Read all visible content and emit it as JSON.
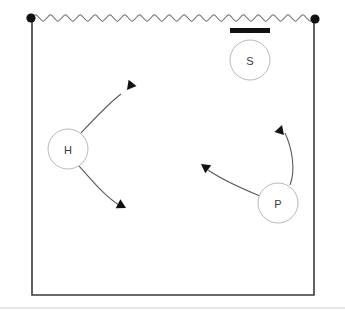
{
  "diagram": {
    "title": "",
    "colors": {
      "frame_stroke": "#3a3a3a",
      "wave_stroke": "#6e6e6e",
      "node_stroke": "#b9b9b9",
      "node_fill": "#ffffff",
      "label_color": "#3b3b3b",
      "arrow_stroke": "#5a5a5a",
      "arrow_fill": "#111111",
      "marker_fill": "#111111",
      "bar_fill": "#111111",
      "baseline_stroke": "#cccccc",
      "background": "#ffffff"
    },
    "frame": {
      "name": "tank-outline",
      "left_x": 32,
      "right_x": 314,
      "top_y": 18,
      "bottom_y": 295
    },
    "surface": {
      "name": "water-surface-wave",
      "label": "wavy free surface",
      "start_x": 32,
      "end_x": 314,
      "y": 18,
      "amplitude": 3.2,
      "periods": 19
    },
    "endpoints": [
      {
        "name": "left-surface-pin",
        "label": "",
        "cx": 31,
        "cy": 18,
        "r": 4.6
      },
      {
        "name": "right-surface-pin",
        "label": "",
        "cx": 315,
        "cy": 19,
        "r": 4.6
      }
    ],
    "bar": {
      "name": "floating-plate",
      "label": "",
      "x": 230,
      "y": 28,
      "width": 40,
      "height": 5
    },
    "nodes": [
      {
        "id": "S",
        "name": "node-s",
        "label": "S",
        "cx": 250,
        "cy": 60,
        "r": 20
      },
      {
        "id": "H",
        "name": "node-h",
        "label": "H",
        "cx": 68,
        "cy": 149,
        "r": 20
      },
      {
        "id": "P",
        "name": "node-p",
        "label": "P",
        "cx": 278,
        "cy": 203,
        "r": 20
      }
    ],
    "arrows": [
      {
        "id": "h-upper",
        "name": "arrow-h-upper-right",
        "label": "",
        "from": "H",
        "path": "M 81 133 C 95 118 108 104 121 94",
        "tip_x": 127,
        "tip_y": 90,
        "tip_angle": 128
      },
      {
        "id": "h-lower",
        "name": "arrow-h-lower-right",
        "label": "",
        "from": "H",
        "path": "M 79 166 C 93 182 106 197 119 205",
        "tip_x": 126,
        "tip_y": 208,
        "tip_angle": 28
      },
      {
        "id": "p-left",
        "name": "arrow-p-upper-left",
        "label": "",
        "from": "P",
        "path": "M 260 196 C 243 189 224 181 208 170",
        "tip_x": 201,
        "tip_y": 164,
        "tip_angle": 216
      },
      {
        "id": "p-up",
        "name": "arrow-p-up",
        "label": "",
        "from": "P",
        "path": "M 290 185 C 296 170 292 148 285 133",
        "tip_x": 282,
        "tip_y": 125,
        "tip_angle": 288
      }
    ],
    "baseline": {
      "name": "page-baseline-rule",
      "label": "",
      "y": 308,
      "x1": 0,
      "x2": 345
    }
  }
}
